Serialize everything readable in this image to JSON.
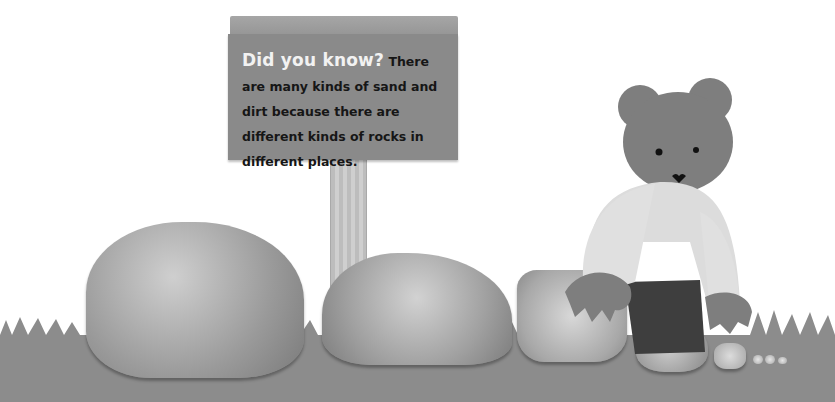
{
  "sign": {
    "lead": "Did you know?",
    "body": " There are many kinds of sand and dirt because there are different kinds of rocks in different places."
  },
  "scene": {
    "objects": [
      "wooden-sign",
      "sign-post",
      "large-granite-rock",
      "medium-granite-rock",
      "small-granite-rock",
      "smaller-rock",
      "tiny-rock",
      "sand-grains",
      "bear-character",
      "grass-ground"
    ],
    "palette": {
      "background": "#ffffff",
      "ground": "#8c8c8c",
      "sign": "#8a8a8a",
      "sign_lead_text": "#f2f2f2",
      "sign_body_text": "#161616",
      "bear_fur": "#7e7e7e",
      "bear_shirt": "#dcdcdc",
      "bear_pants": "#3e3e3e"
    }
  }
}
